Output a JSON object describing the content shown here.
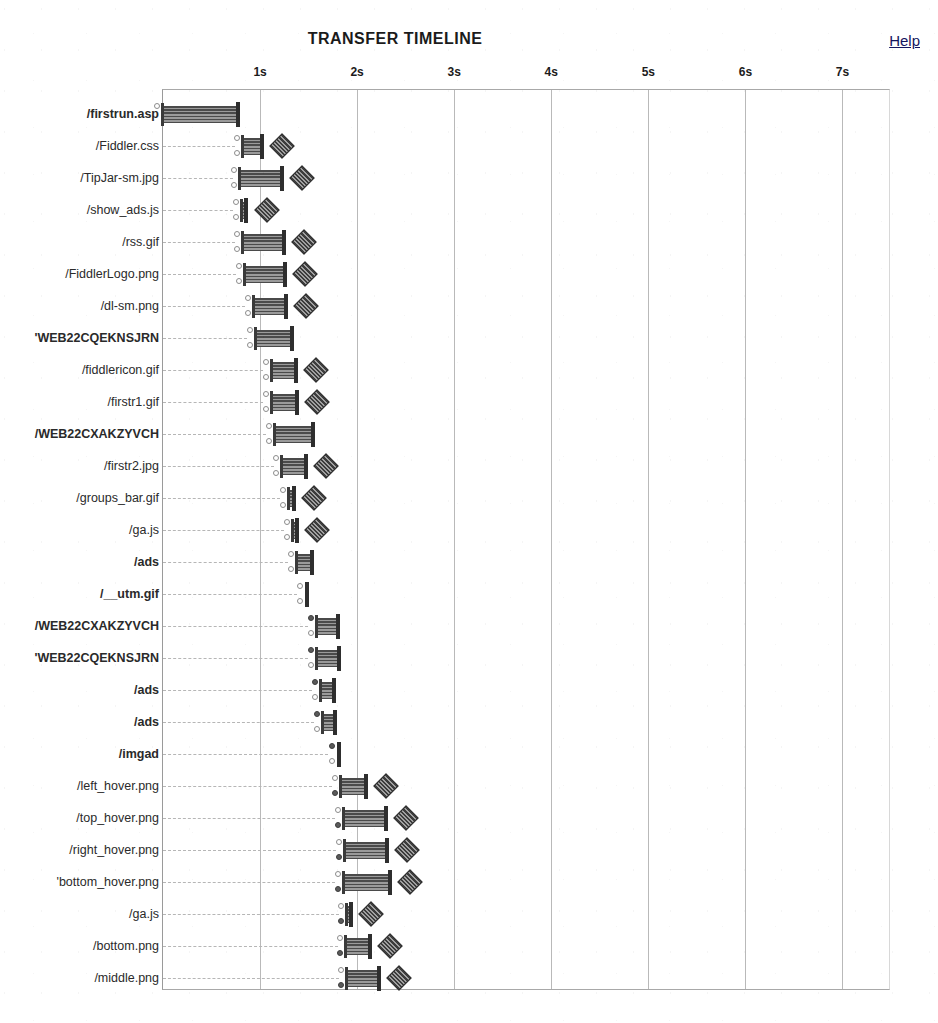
{
  "header": {
    "title": "TRANSFER TIMELINE",
    "help_label": "Help"
  },
  "chart_data": {
    "type": "bar",
    "title": "TRANSFER TIMELINE",
    "xlabel": "",
    "ylabel": "",
    "orientation": "horizontal",
    "grid": true,
    "legend": false,
    "xlim": [
      0,
      7.5
    ],
    "x_unit": "s",
    "tick_labels": [
      "1s",
      "2s",
      "3s",
      "4s",
      "5s",
      "6s",
      "7s"
    ],
    "tick_values": [
      1,
      2,
      3,
      4,
      5,
      6,
      7
    ],
    "categories": [
      "/firstrun.asp",
      "/Fiddler.css",
      "/TipJar-sm.jpg",
      "/show_ads.js",
      "/rss.gif",
      "/FiddlerLogo.png",
      "/dl-sm.png",
      "'WEB22CQEKNSJRN",
      "/fiddlericon.gif",
      "/firstr1.gif",
      "/WEB22CXAKZYVCH",
      "/firstr2.jpg",
      "/groups_bar.gif",
      "/ga.js",
      "/ads",
      "/__utm.gif",
      "/WEB22CXAKZYVCH",
      "'WEB22CQEKNSJRN",
      "/ads",
      "/ads",
      "/imgad",
      "/left_hover.png",
      "/top_hover.png",
      "/right_hover.png",
      "'bottom_hover.png",
      "/ga.js",
      "/bottom.png",
      "/middle.png"
    ],
    "rows": [
      {
        "label": "/firstrun.asp",
        "bold": true,
        "start": 0.0,
        "end": 0.76,
        "dots": 1,
        "diamond": false,
        "leader": 0.0
      },
      {
        "label": "/Fiddler.css",
        "bold": false,
        "start": 0.82,
        "end": 1.01,
        "dots": 2,
        "diamond": true,
        "leader": 0.78
      },
      {
        "label": "/TipJar-sm.jpg",
        "bold": false,
        "start": 0.79,
        "end": 1.22,
        "dots": 2,
        "diamond": true,
        "leader": 0.76
      },
      {
        "label": "/show_ads.js",
        "bold": false,
        "start": 0.81,
        "end": 0.85,
        "dots": 2,
        "diamond": true,
        "leader": 0.76
      },
      {
        "label": "/rss.gif",
        "bold": false,
        "start": 0.82,
        "end": 1.24,
        "dots": 2,
        "diamond": true,
        "leader": 0.78
      },
      {
        "label": "/FiddlerLogo.png",
        "bold": false,
        "start": 0.84,
        "end": 1.25,
        "dots": 2,
        "diamond": true,
        "leader": 0.79
      },
      {
        "label": "/dl-sm.png",
        "bold": false,
        "start": 0.94,
        "end": 1.26,
        "dots": 2,
        "diamond": true,
        "leader": 0.89
      },
      {
        "label": "'WEB22CQEKNSJRN",
        "bold": true,
        "start": 0.96,
        "end": 1.32,
        "dots": 2,
        "diamond": false,
        "leader": 0.91
      },
      {
        "label": "/fiddlericon.gif",
        "bold": false,
        "start": 1.12,
        "end": 1.36,
        "dots": 2,
        "diamond": true,
        "leader": 1.07
      },
      {
        "label": "/firstr1.gif",
        "bold": false,
        "start": 1.12,
        "end": 1.37,
        "dots": 2,
        "diamond": true,
        "leader": 1.07
      },
      {
        "label": "/WEB22CXAKZYVCH",
        "bold": true,
        "start": 1.15,
        "end": 1.53,
        "dots": 2,
        "diamond": false,
        "leader": 1.1
      },
      {
        "label": "/firstr2.jpg",
        "bold": false,
        "start": 1.23,
        "end": 1.46,
        "dots": 2,
        "diamond": true,
        "leader": 1.18
      },
      {
        "label": "/groups_bar.gif",
        "bold": false,
        "start": 1.3,
        "end": 1.34,
        "dots": 2,
        "diamond": true,
        "leader": 1.25
      },
      {
        "label": "/ga.js",
        "bold": false,
        "start": 1.34,
        "end": 1.37,
        "dots": 2,
        "diamond": true,
        "leader": 1.29
      },
      {
        "label": "/ads",
        "bold": true,
        "start": 1.38,
        "end": 1.52,
        "dots": 2,
        "diamond": false,
        "leader": 1.33
      },
      {
        "label": "/__utm.gif",
        "bold": true,
        "start": 1.47,
        "end": 1.47,
        "dots": 2,
        "diamond": false,
        "leader": 1.42
      },
      {
        "label": "/WEB22CXAKZYVCH",
        "bold": true,
        "start": 1.59,
        "end": 1.79,
        "dots": 2,
        "diamond": false,
        "leader": 1.54
      },
      {
        "label": "'WEB22CQEKNSJRN",
        "bold": true,
        "start": 1.59,
        "end": 1.8,
        "dots": 2,
        "diamond": false,
        "leader": 1.54
      },
      {
        "label": "/ads",
        "bold": true,
        "start": 1.63,
        "end": 1.75,
        "dots": 2,
        "diamond": false,
        "leader": 1.58
      },
      {
        "label": "/ads",
        "bold": true,
        "start": 1.65,
        "end": 1.76,
        "dots": 2,
        "diamond": false,
        "leader": 1.6
      },
      {
        "label": "/imgad",
        "bold": true,
        "start": 1.8,
        "end": 1.8,
        "dots": 2,
        "diamond": false,
        "leader": 1.74
      },
      {
        "label": "/left_hover.png",
        "bold": false,
        "start": 1.83,
        "end": 2.08,
        "dots": 2,
        "diamond": true,
        "leader": 1.78
      },
      {
        "label": "/top_hover.png",
        "bold": false,
        "start": 1.86,
        "end": 2.29,
        "dots": 2,
        "diamond": true,
        "leader": 1.81
      },
      {
        "label": "/right_hover.png",
        "bold": false,
        "start": 1.87,
        "end": 2.3,
        "dots": 2,
        "diamond": true,
        "leader": 1.82
      },
      {
        "label": "'bottom_hover.png",
        "bold": false,
        "start": 1.86,
        "end": 2.33,
        "dots": 2,
        "diamond": true,
        "leader": 1.81
      },
      {
        "label": "/ga.js",
        "bold": false,
        "start": 1.9,
        "end": 1.93,
        "dots": 2,
        "diamond": true,
        "leader": 1.85
      },
      {
        "label": "/bottom.png",
        "bold": false,
        "start": 1.89,
        "end": 2.12,
        "dots": 2,
        "diamond": true,
        "leader": 1.84
      },
      {
        "label": "/middle.png",
        "bold": false,
        "start": 1.9,
        "end": 2.21,
        "dots": 2,
        "diamond": true,
        "leader": 1.85
      }
    ]
  },
  "colors": {
    "bar": "#6d6d6d",
    "bar_hatch": "#4a4a4a",
    "grid": "#b9b9b9",
    "frame": "#9a9a9a",
    "text": "#1b1b1b",
    "link": "#15155e"
  }
}
